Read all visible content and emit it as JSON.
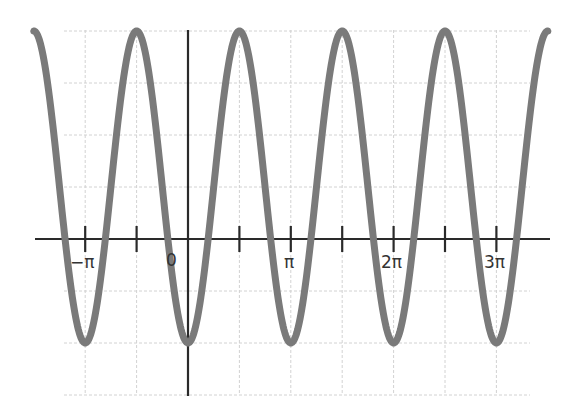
{
  "chart_data": {
    "type": "line",
    "title": "",
    "xlabel": "",
    "ylabel": "",
    "function": "y = 1 - 3cos(2x)",
    "xlim": [
      -4.712,
      10.996
    ],
    "ylim": [
      -3,
      4
    ],
    "grid": true,
    "legend": null,
    "x_ticks": [
      {
        "value": -3.1416,
        "label": "−π"
      },
      {
        "value": -1.5708,
        "label": ""
      },
      {
        "value": 0,
        "label": "0"
      },
      {
        "value": 1.5708,
        "label": ""
      },
      {
        "value": 3.1416,
        "label": "π"
      },
      {
        "value": 4.7124,
        "label": ""
      },
      {
        "value": 6.2832,
        "label": "2π"
      },
      {
        "value": 7.854,
        "label": ""
      },
      {
        "value": 9.4248,
        "label": "3π"
      }
    ],
    "series": [
      {
        "name": "curve",
        "color": "#7a7a7a",
        "x": [
          -4.712,
          -3.1416,
          -1.5708,
          0,
          1.5708,
          3.1416,
          4.7124,
          6.2832,
          7.854,
          9.4248,
          10.996
        ],
        "y": [
          4,
          -2,
          4,
          -2,
          4,
          -2,
          4,
          -2,
          4,
          -2,
          4
        ]
      }
    ],
    "colors": {
      "curve": "#7a7a7a",
      "axis": "#2a2a2a",
      "grid": "#cfcfcf"
    }
  },
  "labels": {
    "neg_pi": "−π",
    "zero": "0",
    "pi": "π",
    "two_pi": "2π",
    "three_pi": "3π"
  }
}
